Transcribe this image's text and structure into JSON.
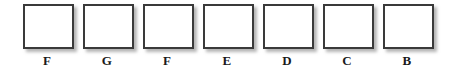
{
  "canvas": {
    "width": 453,
    "height": 71,
    "background_color": "#ffffff"
  },
  "style": {
    "box_border_color": "#3a3a3a",
    "box_fill_color": "#ffffff",
    "label_color": "#1a1a1a",
    "shadow_color": "#787878"
  },
  "boxes": [
    {
      "label": "F",
      "value": "",
      "x": 20
    },
    {
      "label": "G",
      "value": "",
      "x": 80
    },
    {
      "label": "F",
      "value": "",
      "x": 140
    },
    {
      "label": "E",
      "value": "",
      "x": 200
    },
    {
      "label": "D",
      "value": "",
      "x": 260
    },
    {
      "label": "C",
      "value": "",
      "x": 320
    },
    {
      "label": "B",
      "value": "",
      "x": 380
    }
  ]
}
